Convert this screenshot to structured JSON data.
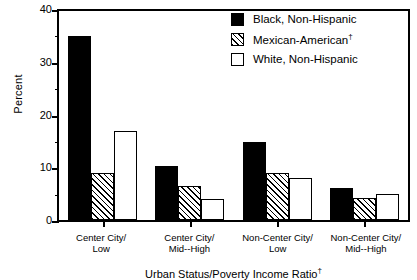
{
  "chart_data": {
    "type": "bar",
    "title": "",
    "xlabel": "Urban Status/Poverty Income Ratio†",
    "ylabel": "Percent",
    "ylim": [
      0,
      40
    ],
    "yticks": [
      0,
      10,
      20,
      30,
      40
    ],
    "yticks_minor": [
      5,
      15,
      25,
      35
    ],
    "grid": false,
    "legend_position": "top-right",
    "categories": [
      "Center City/\nLow",
      "Center City/\nMid--High",
      "Non-Center City/\nLow",
      "Non-Center City/\nMid--High"
    ],
    "series": [
      {
        "name": "Black, Non-Hispanic",
        "fill": "black",
        "values": [
          34.8,
          10.3,
          14.8,
          6.0
        ]
      },
      {
        "name": "Mexican-American†",
        "fill": "hatch",
        "values": [
          9.0,
          6.4,
          8.9,
          4.1
        ]
      },
      {
        "name": "White, Non-Hispanic",
        "fill": "white",
        "values": [
          16.9,
          4.0,
          8.0,
          5.0
        ]
      }
    ]
  },
  "axis": {
    "y_title": "Percent",
    "x_title_text": "Urban Status/Poverty Income Ratio",
    "x_title_dagger": "†",
    "y_tick_labels": [
      "40",
      "30",
      "20",
      "10",
      "0"
    ]
  },
  "categories": [
    {
      "line1": "Center City/",
      "line2": "Low"
    },
    {
      "line1": "Center City/",
      "line2": "Mid--High"
    },
    {
      "line1": "Non-Center City/",
      "line2": "Low"
    },
    {
      "line1": "Non-Center City/",
      "line2": "Mid--High"
    }
  ],
  "legend": {
    "items": [
      {
        "label": "Black, Non-Hispanic",
        "dagger": "",
        "fill": "black"
      },
      {
        "label": "Mexican-American",
        "dagger": "†",
        "fill": "hatch"
      },
      {
        "label": "White, Non-Hispanic",
        "dagger": "",
        "fill": "white"
      }
    ]
  },
  "colors": {
    "ink": "#000000",
    "paper": "#ffffff"
  }
}
